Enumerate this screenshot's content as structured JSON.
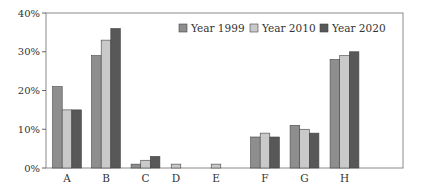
{
  "chart_data": {
    "type": "bar",
    "title": "",
    "xlabel": "",
    "ylabel": "",
    "categories": [
      "A",
      "B",
      "C",
      "D",
      "E",
      "F",
      "G",
      "H"
    ],
    "series": [
      {
        "name": "Year 1999",
        "color": "#8e8e8e",
        "values": [
          21,
          29,
          1,
          null,
          null,
          8,
          11,
          28
        ]
      },
      {
        "name": "Year 2010",
        "color": "#c9c9c9",
        "values": [
          15,
          33,
          2,
          1,
          1,
          9,
          10,
          29
        ]
      },
      {
        "name": "Year 2020",
        "color": "#585858",
        "values": [
          15,
          36,
          3,
          null,
          null,
          8,
          9,
          30
        ]
      }
    ],
    "ylim": [
      0,
      40
    ],
    "yticks": [
      0,
      10,
      20,
      30,
      40
    ],
    "ytick_labels": [
      "0%",
      "10%",
      "20%",
      "30%",
      "40%"
    ],
    "grid": false,
    "legend_position": "top-right, inside plot"
  },
  "legend": {
    "items": [
      {
        "label": "Year 1999",
        "color": "#8e8e8e"
      },
      {
        "label": "Year 2010",
        "color": "#c9c9c9"
      },
      {
        "label": "Year 2020",
        "color": "#585858"
      }
    ]
  },
  "layout": {
    "plot_left": 46,
    "plot_right": 403,
    "plot_top": 13,
    "plot_bottom": 168,
    "bar_width": 9.6,
    "group_centers": [
      67,
      106,
      145.5,
      176,
      216,
      265,
      304.5,
      344.5
    ]
  }
}
